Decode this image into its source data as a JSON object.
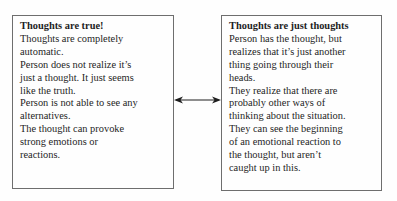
{
  "left_box": {
    "title": "Thoughts are true!",
    "lines": [
      "Thoughts are completely",
      "automatic.",
      "Person does not realize it’s",
      "just a thought. It just seems",
      "like the truth.",
      "Person is not able to see any",
      "alternatives.",
      "The thought can provoke",
      "strong emotions or",
      "reactions."
    ]
  },
  "right_box": {
    "title": "Thoughts are just thoughts",
    "lines": [
      "Person has the thought, but",
      "realizes that it’s just another",
      "thing going through their",
      "heads.",
      "They realize that there are",
      "probably other ways of",
      "thinking about the situation.",
      "They can see the beginning",
      "of an emotional reaction to",
      "the thought, but aren’t",
      "caught up in this."
    ]
  },
  "connector": {
    "type": "double-headed-arrow",
    "color": "#1e1e1e"
  }
}
